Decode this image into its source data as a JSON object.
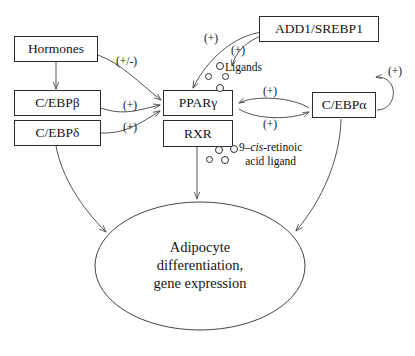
{
  "diagram": {
    "background_color": "#ffffff",
    "stroke_color": "#4a4a4a",
    "text_color": "#151515",
    "nodes": [
      {
        "id": "hormones",
        "label": "Hormones",
        "shape": "box"
      },
      {
        "id": "cebpb",
        "label": "C/EBPβ",
        "shape": "box"
      },
      {
        "id": "cebpd",
        "label": "C/EBPδ",
        "shape": "box"
      },
      {
        "id": "ppary",
        "label": "PPARγ",
        "shape": "box"
      },
      {
        "id": "rxr",
        "label": "RXR",
        "shape": "box"
      },
      {
        "id": "add1",
        "label": "ADD1/SREBP1",
        "shape": "box"
      },
      {
        "id": "cebpa",
        "label": "C/EBPα",
        "shape": "box"
      },
      {
        "id": "outcome",
        "label": "Adipocyte differentiation, gene expression",
        "shape": "ellipse"
      }
    ],
    "outcome_lines": [
      "Adipocyte",
      "differentiation,",
      "gene expression"
    ],
    "annotations": {
      "ligands_label": "Ligands",
      "retinoic_prefix": "9–",
      "retinoic_italic": "cis",
      "retinoic_suffix": "-retinoic",
      "retinoic_line2": "acid ligand"
    },
    "edge_labels": {
      "hormones_to_ppary": "(+/-)",
      "cebpb_to_ppary": "(+)",
      "cebpd_to_ppary": "(+)",
      "add1_to_ppary": "(+)",
      "add1_to_ligands": "(+)",
      "cebpa_to_ppary": "(+)",
      "ppary_to_cebpa": "(+)",
      "cebpa_self": "(+)"
    },
    "edges": [
      {
        "from": "hormones",
        "to": "cebpb",
        "label": "",
        "style": "straight-arrow"
      },
      {
        "from": "hormones",
        "to": "ppary",
        "label": "(+/-)",
        "style": "curved-arrow"
      },
      {
        "from": "cebpb",
        "to": "ppary",
        "label": "(+)",
        "style": "curved-arrow"
      },
      {
        "from": "cebpd",
        "to": "ppary",
        "label": "(+)",
        "style": "curved-arrow"
      },
      {
        "from": "cebpd",
        "to": "outcome",
        "label": "",
        "style": "curved-arrow"
      },
      {
        "from": "add1",
        "to": "ppary",
        "label": "(+)",
        "style": "curved-arrow"
      },
      {
        "from": "add1",
        "to": "ligands",
        "label": "(+)",
        "style": "curved-arrow"
      },
      {
        "from": "cebpa",
        "to": "ppary",
        "label": "(+)",
        "style": "curved-arrow"
      },
      {
        "from": "ppary",
        "to": "cebpa",
        "label": "(+)",
        "style": "curved-arrow"
      },
      {
        "from": "cebpa",
        "to": "cebpa",
        "label": "(+)",
        "style": "self-loop"
      },
      {
        "from": "cebpa",
        "to": "outcome",
        "label": "",
        "style": "curved-arrow"
      },
      {
        "from": "rxr",
        "to": "outcome",
        "label": "",
        "style": "straight-arrow"
      }
    ]
  }
}
